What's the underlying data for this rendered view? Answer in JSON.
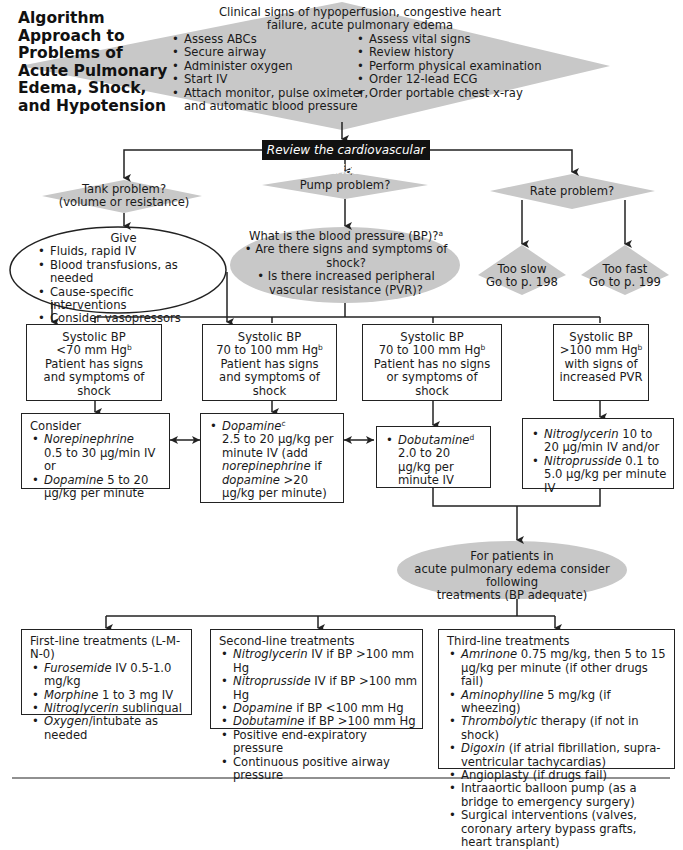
{
  "title": "Algorithm Approach to Problems of Acute Pulmonary Edema, Shock, and Hypotension",
  "colors": {
    "shape_fill": "#c8c8c8",
    "line": "#222222",
    "banner": "#111111"
  },
  "top_diamond": {
    "heading": "Clinical signs of hypoperfusion, congestive heart failure, acute pulmonary edema",
    "left_items": [
      "Assess ABCs",
      "Secure airway",
      "Administer oxygen",
      "Start IV",
      "Attach monitor, pulse oximeter, and automatic blood pressure"
    ],
    "right_items": [
      "Assess vital signs",
      "Review history",
      "Perform physical examination",
      "Order 12-lead ECG",
      "Order portable chest x-ray"
    ]
  },
  "banner": "Review the cardiovascular triad",
  "tank": {
    "line1": "Tank problem?",
    "line2": "(volume or resistance)"
  },
  "pump": {
    "label": "Pump problem?"
  },
  "rate": {
    "label": "Rate problem?"
  },
  "give": {
    "heading": "Give",
    "items": [
      "Fluids, rapid IV",
      "Blood transfusions, as needed",
      "Cause-specific interventions",
      "Consider vasopressors"
    ]
  },
  "bp_question": {
    "heading": "What is the blood pressure (BP)?",
    "heading_sup": "a",
    "items": [
      "Are there signs and symptoms of shock?",
      "Is there increased peripheral vascular resistance (PVR)?"
    ]
  },
  "too_slow": {
    "line1": "Too slow",
    "line2": "Go to p. 198"
  },
  "too_fast": {
    "line1": "Too fast",
    "line2": "Go to p. 199"
  },
  "bp_boxes": [
    {
      "l1": "Systolic BP",
      "l2": "<70 mm Hg",
      "sup": "b",
      "l3": "Patient has signs and symptoms of shock"
    },
    {
      "l1": "Systolic BP",
      "l2": "70 to 100 mm Hg",
      "sup": "b",
      "l3": "Patient has signs and symptoms of shock"
    },
    {
      "l1": "Systolic BP",
      "l2": "70 to 100 mm Hg",
      "sup": "b",
      "l3": "Patient has no signs or symptoms of shock"
    },
    {
      "l1": "Systolic BP",
      "l2": ">100 mm Hg",
      "sup": "b",
      "l3": "with signs of increased PVR"
    }
  ],
  "treatments": {
    "consider": {
      "heading": "Consider",
      "items": [
        {
          "drug": "Norepinephrine",
          "dose": "0.5 to 30 µg/min IV or"
        },
        {
          "drug": "Dopamine",
          "dose": "5 to 20 µg/kg per minute"
        }
      ]
    },
    "dopamine": {
      "drug": "Dopamine",
      "sup": "c",
      "dose1": "2.5 to 20 µg/kg per minute IV (add",
      "drug2": "norepinephrine",
      "dose2": "if",
      "drug3": "dopamine",
      "dose3": ">20 µg/kg per minute)"
    },
    "dobutamine": {
      "drug": "Dobutamine",
      "sup": "d",
      "dose": "2.0 to 20 µg/kg per minute IV"
    },
    "nitro": {
      "items": [
        {
          "drug": "Nitroglycerin",
          "dose": "10 to 20 µg/min IV and/or"
        },
        {
          "drug": "Nitroprusside",
          "dose": "0.1 to 5.0 µg/kg per minute IV"
        }
      ]
    }
  },
  "pulm_edema": {
    "line1": "For patients in",
    "line2": "acute pulmonary edema consider following",
    "line3": "treatments (BP adequate)"
  },
  "first_line": {
    "heading": "First-line treatments (L-M-N-0)",
    "items": [
      {
        "drug": "Furosemide",
        "rest": "IV 0.5-1.0 mg/kg"
      },
      {
        "drug": "Morphine",
        "rest": "1 to 3 mg IV"
      },
      {
        "drug": "Nitroglycerin",
        "rest": "sublingual"
      },
      {
        "drug": "Oxygen",
        "rest": "/intubate as needed"
      }
    ]
  },
  "second_line": {
    "heading": "Second-line treatments",
    "items": [
      {
        "drug": "Nitroglycerin",
        "rest": "IV if BP >100 mm Hg"
      },
      {
        "drug": "Nitroprusside",
        "rest": "IV if BP >100 mm Hg"
      },
      {
        "drug": "Dopamine",
        "rest": "if BP <100 mm Hg"
      },
      {
        "drug": "Dobutamine",
        "rest": "if BP >100 mm Hg"
      },
      {
        "drug": "",
        "rest": "Positive end-expiratory pressure"
      },
      {
        "drug": "",
        "rest": "Continuous positive airway pressure"
      }
    ]
  },
  "third_line": {
    "heading": "Third-line treatments",
    "items": [
      {
        "drug": "Amrinone",
        "rest": "0.75 mg/kg, then 5 to 15 µg/kg per minute (if other drugs fail)"
      },
      {
        "drug": "Aminophylline",
        "rest": "5 mg/kg (if wheezing)"
      },
      {
        "drug": "Thrombolytic",
        "rest": "therapy (if not in shock)"
      },
      {
        "drug": "Digoxin",
        "rest": "(if atrial fibrillation, supra-ventricular tachycardias)"
      },
      {
        "drug": "",
        "rest": "Angioplasty (if drugs fail)"
      },
      {
        "drug": "",
        "rest": "Intraaortic balloon pump (as a bridge to emergency surgery)"
      },
      {
        "drug": "",
        "rest": "Surgical interventions (valves, coronary artery bypass grafts, heart transplant)"
      }
    ]
  }
}
